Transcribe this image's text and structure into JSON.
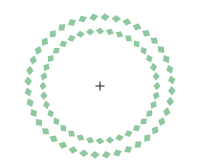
{
  "canvas": {
    "width": 199,
    "height": 162,
    "background": "#ffffff"
  },
  "figure": {
    "center": {
      "x": 100,
      "y": 86
    },
    "fixation_cross": {
      "icon": "plus-icon",
      "size": 9,
      "stroke_width": 1.2,
      "color": "#3a3a3a"
    },
    "rings": [
      {
        "name": "outer-ring",
        "radius_x": 72,
        "radius_y": 69,
        "element_count": 40,
        "element_size": 6,
        "tilt_deg": 30,
        "skew_deg": -12,
        "color": "#86c397",
        "start_angle_deg": 4
      },
      {
        "name": "inner-ring",
        "radius_x": 57,
        "radius_y": 55,
        "element_count": 36,
        "element_size": 5.6,
        "tilt_deg": -30,
        "skew_deg": 12,
        "color": "#86c397",
        "start_angle_deg": 0
      }
    ]
  }
}
